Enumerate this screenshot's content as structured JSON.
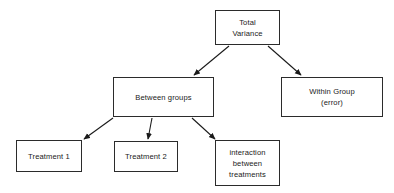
{
  "diagram": {
    "type": "flowchart",
    "canvas": {
      "width": 394,
      "height": 193,
      "background": "#ffffff"
    },
    "style": {
      "border_color": "#2b2b2b",
      "text_color": "#1a1a1a",
      "arrow_color": "#1a1a1a"
    },
    "nodes": [
      {
        "id": "total-variance",
        "lines": [
          "Total",
          "Variance"
        ],
        "line1": "Total",
        "line2": "Variance",
        "line3": ""
      },
      {
        "id": "between-groups",
        "lines": [
          "Between groups"
        ],
        "line1": "Between groups",
        "line2": "",
        "line3": ""
      },
      {
        "id": "within-group",
        "lines": [
          "Within Group",
          "(error)"
        ],
        "line1": "Within Group",
        "line2": "(error)",
        "line3": ""
      },
      {
        "id": "treatment-1",
        "lines": [
          "Treatment 1"
        ],
        "line1": "Treatment 1",
        "line2": "",
        "line3": ""
      },
      {
        "id": "treatment-2",
        "lines": [
          "Treatment 2"
        ],
        "line1": "Treatment 2",
        "line2": "",
        "line3": ""
      },
      {
        "id": "interaction",
        "lines": [
          "interaction",
          "between",
          "treatments"
        ],
        "line1": "interaction",
        "line2": "between",
        "line3": "treatments"
      }
    ],
    "edges": [
      {
        "id": "total-to-between",
        "from": "total-variance",
        "to": "between-groups",
        "x1": 229,
        "y1": 46,
        "x2": 194,
        "y2": 75
      },
      {
        "id": "total-to-within",
        "from": "total-variance",
        "to": "within-group",
        "x1": 268,
        "y1": 46,
        "x2": 301,
        "y2": 75
      },
      {
        "id": "between-to-treatment-1",
        "from": "between-groups",
        "to": "treatment-1",
        "x1": 113,
        "y1": 118,
        "x2": 84,
        "y2": 139
      },
      {
        "id": "between-to-treatment-2",
        "from": "between-groups",
        "to": "treatment-2",
        "x1": 152,
        "y1": 118,
        "x2": 148,
        "y2": 139
      },
      {
        "id": "between-to-interaction",
        "from": "between-groups",
        "to": "interaction",
        "x1": 192,
        "y1": 118,
        "x2": 215,
        "y2": 139
      }
    ]
  }
}
